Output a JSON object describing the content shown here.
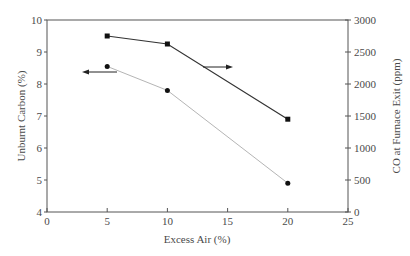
{
  "chart_data": {
    "type": "line",
    "title": "",
    "xlabel": "Excess Air (%)",
    "ylabel": "Unburnt Carbon (%)",
    "y2label": "CO at Furnace Exit (ppm)",
    "xlim": [
      0,
      25
    ],
    "ylim": [
      4,
      10
    ],
    "y2lim": [
      0,
      3000
    ],
    "x_ticks": [
      0,
      5,
      10,
      15,
      20,
      25
    ],
    "y_ticks": [
      4,
      5,
      6,
      7,
      8,
      9,
      10
    ],
    "y2_ticks": [
      0,
      500,
      1000,
      1500,
      2000,
      2500,
      3000
    ],
    "grid": false,
    "legend": "none (arrows indicate axis)",
    "x": [
      5,
      10,
      20
    ],
    "series": [
      {
        "name": "Unburnt Carbon (%)",
        "axis": "left",
        "marker": "circle",
        "line_color": "#b5b5b5",
        "marker_color": "#111111",
        "values": [
          8.55,
          7.8,
          4.9
        ]
      },
      {
        "name": "CO at Furnace Exit (ppm)",
        "axis": "right",
        "marker": "square",
        "line_color": "#333333",
        "marker_color": "#111111",
        "values": [
          2750,
          2625,
          1450
        ]
      }
    ],
    "annotations": [
      {
        "type": "arrow",
        "direction": "left",
        "points_to": "left axis",
        "near_series": "Unburnt Carbon (%)"
      },
      {
        "type": "arrow",
        "direction": "right",
        "points_to": "right axis",
        "near_series": "CO at Furnace Exit (ppm)"
      }
    ]
  },
  "labels": {
    "xlabel": "Excess Air (%)",
    "ylabel": "Unburnt Carbon (%)",
    "y2label": "CO at Furnace Exit (ppm)",
    "x_ticks": [
      "0",
      "5",
      "10",
      "15",
      "20",
      "25"
    ],
    "y_ticks": [
      "4",
      "5",
      "6",
      "7",
      "8",
      "9",
      "10"
    ],
    "y2_ticks": [
      "0",
      "500",
      "1000",
      "1500",
      "2000",
      "2500",
      "3000"
    ]
  }
}
